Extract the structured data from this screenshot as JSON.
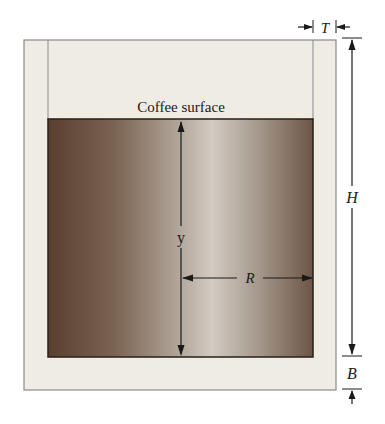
{
  "diagram": {
    "labels": {
      "surface": "Coffee surface",
      "depth": "y",
      "radius": "R",
      "height": "H",
      "wall_thickness": "T",
      "bottom_thickness": "B"
    },
    "colors": {
      "cup_fill": "#efece4",
      "cup_stroke": "#8a8a86",
      "coffee_dark": "#5a3f31",
      "coffee_mid": "#8c7664",
      "coffee_light": "#d0c8be",
      "coffee_right": "#6f5848",
      "line": "#1a1a1a"
    }
  }
}
